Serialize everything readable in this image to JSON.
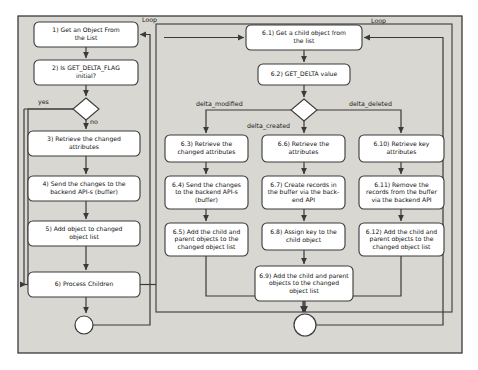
{
  "diagram": {
    "background": "#d9d7d2",
    "page_background": "#ffffff",
    "node_fill": "#ffffff",
    "stroke": "#3a3a3a",
    "outer_frame": {
      "x": 18,
      "y": 16,
      "w": 444,
      "h": 337
    },
    "inner_frame": {
      "x": 156,
      "y": 24,
      "w": 296,
      "h": 288
    }
  },
  "left_branch": {
    "nodes": [
      {
        "id": "n1",
        "label": "1) Get an Object From\nthe List",
        "x": 34,
        "y": 22,
        "w": 104,
        "h": 25,
        "lines": [
          "1) Get an Object From",
          "the List"
        ]
      },
      {
        "id": "n2",
        "label": "2) Is GET_DELTA_FLAG\ninitial?",
        "x": 34,
        "y": 60,
        "w": 104,
        "h": 25,
        "lines": [
          "2) Is GET_DELTA_FLAG",
          "initial?"
        ]
      },
      {
        "id": "n3",
        "label": "3) Retrieve the changed\nattributes",
        "x": 28,
        "y": 131,
        "w": 112,
        "h": 25,
        "lines": [
          "3) Retrieve the changed",
          "attributes"
        ]
      },
      {
        "id": "n4",
        "label": "4) Send the changes to the\nbackend API-s (buffer)",
        "x": 28,
        "y": 176,
        "w": 112,
        "h": 25,
        "lines": [
          "4) Send the changes to the",
          "backend API-s (buffer)"
        ]
      },
      {
        "id": "n5",
        "label": "5) Add object to changed\nobject list",
        "x": 28,
        "y": 221,
        "w": 112,
        "h": 25,
        "lines": [
          "5) Add object to changed",
          "object list"
        ]
      },
      {
        "id": "n6",
        "label": "6) Process Children",
        "x": 28,
        "y": 272,
        "w": 112,
        "h": 25,
        "lines": [
          "6) Process Children"
        ]
      }
    ],
    "decision": {
      "id": "d1",
      "cx": 86,
      "cy": 109,
      "rx": 13,
      "ry": 11
    },
    "labels": [
      {
        "id": "yes",
        "text": "yes",
        "x": 38,
        "y": 104
      },
      {
        "id": "no",
        "text": "no",
        "x": 90,
        "y": 124
      },
      {
        "id": "loop-left",
        "text": "Loop",
        "x": 142,
        "y": 22
      }
    ],
    "end_circle": {
      "cx": 84,
      "cy": 325,
      "r": 9
    }
  },
  "right_branch": {
    "nodes": [
      {
        "id": "n61",
        "label": "6.1) Get a child object from\nthe list",
        "x": 246,
        "y": 25,
        "w": 116,
        "h": 25,
        "lines": [
          "6.1) Get a child object from",
          "the list"
        ]
      },
      {
        "id": "n62",
        "label": "6.2) GET_DELTA value",
        "x": 258,
        "y": 64,
        "w": 92,
        "h": 21,
        "lines": [
          "6.2)  GET_DELTA value"
        ]
      },
      {
        "id": "n63",
        "label": "6.3) Retrieve the changed attributes",
        "x": 165,
        "y": 135,
        "w": 83,
        "h": 27,
        "lines": [
          "6.3)  Retrieve the",
          "changed attributes"
        ]
      },
      {
        "id": "n64",
        "label": "6.4) Send the changes to the backend API-s (buffer)",
        "x": 165,
        "y": 176,
        "w": 83,
        "h": 33,
        "lines": [
          "6.4) Send the changes",
          "to the backend API-s",
          "(buffer)"
        ]
      },
      {
        "id": "n65",
        "label": "6.5) Add the child and parent objects to the changed object list",
        "x": 165,
        "y": 223,
        "w": 83,
        "h": 33,
        "lines": [
          "6.5) Add the child and",
          "parent objects to the",
          "changed object list"
        ]
      },
      {
        "id": "n66",
        "label": "6.6) Retrieve the attributes",
        "x": 262,
        "y": 135,
        "w": 83,
        "h": 27,
        "lines": [
          "6.6)  Retrieve the",
          "attributes"
        ]
      },
      {
        "id": "n67",
        "label": "6.7) Create records in the buffer via the back-end API",
        "x": 262,
        "y": 176,
        "w": 83,
        "h": 33,
        "lines": [
          "6.7) Create records in",
          "the buffer via the back-",
          "end API"
        ]
      },
      {
        "id": "n68",
        "label": "6.8) Assign key to the child object",
        "x": 262,
        "y": 223,
        "w": 83,
        "h": 27,
        "lines": [
          "6.8) Assign key to the",
          "child object"
        ]
      },
      {
        "id": "n69",
        "label": "6.9) Add the child and parent objects to the changed object list",
        "x": 255,
        "y": 266,
        "w": 98,
        "h": 35,
        "lines": [
          "6.9) Add the child and parent",
          "objects to the changed",
          "object list"
        ]
      },
      {
        "id": "n610",
        "label": "6.10) Retrieve key attributes",
        "x": 359,
        "y": 135,
        "w": 85,
        "h": 27,
        "lines": [
          "6.10)  Retrieve key",
          "attributes"
        ]
      },
      {
        "id": "n611",
        "label": "6.11) Remove the records from the buffer via the backend API",
        "x": 359,
        "y": 176,
        "w": 85,
        "h": 33,
        "lines": [
          "6.11) Remove the",
          "records from the buffer",
          "via the backend API"
        ]
      },
      {
        "id": "n612",
        "label": "6.12) Add the child and parent objects to the changed object list",
        "x": 359,
        "y": 223,
        "w": 85,
        "h": 33,
        "lines": [
          "6.12) Add the child and",
          "parent objects to the",
          "changed object list"
        ]
      }
    ],
    "decision": {
      "id": "d2",
      "cx": 304,
      "cy": 110,
      "rx": 13,
      "ry": 11
    },
    "labels": [
      {
        "id": "delta-modified",
        "text": "delta_modified",
        "x": 196,
        "y": 106
      },
      {
        "id": "delta-created",
        "text": "delta_created",
        "x": 247,
        "y": 128
      },
      {
        "id": "delta-deleted",
        "text": "delta_deleted",
        "x": 349,
        "y": 106
      },
      {
        "id": "loop-right",
        "text": "Loop",
        "x": 371,
        "y": 23
      }
    ],
    "end_circle": {
      "cx": 305,
      "cy": 325,
      "r": 11
    }
  }
}
